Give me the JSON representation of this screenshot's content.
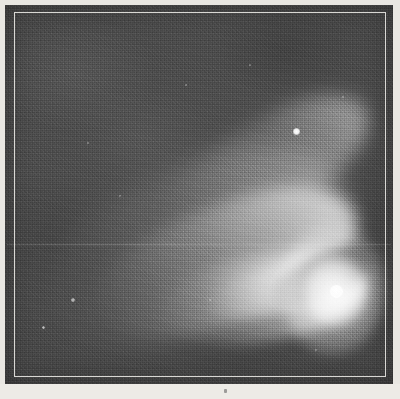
{
  "figure": {
    "medium": "halftone reproduction of an astronomical photograph",
    "subject_name": "comet",
    "background_tone": "#4a4a4a",
    "frame_color": "#f5f3ee",
    "paper_color": "#e9e7e2"
  },
  "plate": {
    "label": "photographic-plate",
    "border_label": "plate frame rule",
    "artifact_label": "plate scratch"
  },
  "comet": {
    "nucleus_label": "nucleus",
    "coma_label": "coma",
    "tail_label": "tail",
    "tail_branches": [
      {
        "name": "northern streamer",
        "direction": "upper-left",
        "brightness": "faint"
      },
      {
        "name": "main tail",
        "direction": "upper-left",
        "brightness": "bright"
      },
      {
        "name": "southern streamer",
        "direction": "left",
        "brightness": "bright"
      }
    ],
    "rift_label": "dark rift between streamers"
  },
  "stars": [
    {
      "name": "field-star-1",
      "x": 296,
      "y": 131,
      "size": 7,
      "brightness": "bright"
    },
    {
      "name": "field-star-2",
      "x": 73,
      "y": 300,
      "size": 4,
      "brightness": "faint"
    },
    {
      "name": "field-star-3",
      "x": 43,
      "y": 327,
      "size": 3,
      "brightness": "faint"
    },
    {
      "name": "field-star-4",
      "x": 343,
      "y": 97,
      "size": 2,
      "brightness": "very faint"
    },
    {
      "name": "field-star-5",
      "x": 186,
      "y": 85,
      "size": 2,
      "brightness": "very faint"
    },
    {
      "name": "field-star-6",
      "x": 120,
      "y": 196,
      "size": 2,
      "brightness": "very faint"
    },
    {
      "name": "field-star-7",
      "x": 250,
      "y": 65,
      "size": 2,
      "brightness": "very faint"
    },
    {
      "name": "field-star-8",
      "x": 88,
      "y": 143,
      "size": 2,
      "brightness": "very faint"
    },
    {
      "name": "field-star-9",
      "x": 316,
      "y": 350,
      "size": 2,
      "brightness": "very faint"
    },
    {
      "name": "field-star-10",
      "x": 210,
      "y": 300,
      "size": 2,
      "brightness": "very faint"
    }
  ],
  "caption": {
    "text": "",
    "mark": "·"
  }
}
